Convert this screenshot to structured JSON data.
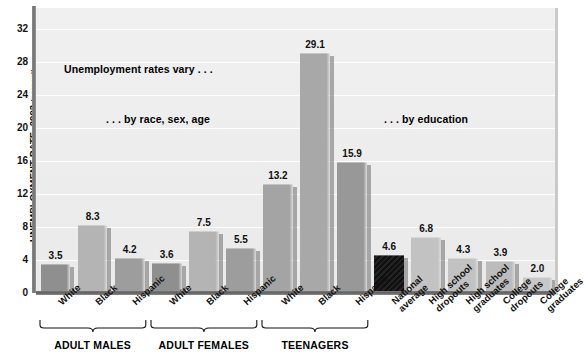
{
  "chart_data": {
    "type": "bar",
    "title": "",
    "xlabel": "",
    "ylabel": "UNEMPLOYMENT RATE, 2003",
    "ylabel_unit": "(percent)",
    "ylim": [
      0,
      34
    ],
    "yticks": [
      0,
      4,
      8,
      12,
      16,
      20,
      24,
      28,
      32
    ],
    "grid": true,
    "legend": "none",
    "categories": [
      "White",
      "Black",
      "Hispanic",
      "White",
      "Black",
      "Hispanic",
      "White",
      "Black",
      "Hispanic",
      "National average",
      "High school dropouts",
      "High school graduates",
      "College dropouts",
      "College graduates"
    ],
    "values": [
      3.5,
      8.3,
      4.2,
      3.6,
      7.5,
      5.5,
      13.2,
      29.1,
      15.9,
      4.6,
      6.8,
      4.3,
      3.9,
      2.0
    ],
    "groups": [
      {
        "label": "ADULT MALES",
        "start": 0,
        "end": 2
      },
      {
        "label": "ADULT FEMALES",
        "start": 3,
        "end": 5
      },
      {
        "label": "TEENAGERS",
        "start": 6,
        "end": 8
      }
    ],
    "annotations": [
      "Unemployment rates vary . . .",
      ". . . by race, sex, age",
      ". . . by education"
    ]
  },
  "bars": [
    {
      "label": "White",
      "value": 3.5,
      "display": "3.5",
      "color": "#8f8f8f"
    },
    {
      "label": "Black",
      "value": 8.3,
      "display": "8.3",
      "color": "#b4b4b4"
    },
    {
      "label": "Hispanic",
      "value": 4.2,
      "display": "4.2",
      "color": "#9d9d9d"
    },
    {
      "label": "White",
      "value": 3.6,
      "display": "3.6",
      "color": "#8f8f8f"
    },
    {
      "label": "Black",
      "value": 7.5,
      "display": "7.5",
      "color": "#b4b4b4"
    },
    {
      "label": "Hispanic",
      "value": 5.5,
      "display": "5.5",
      "color": "#9d9d9d"
    },
    {
      "label": "White",
      "value": 13.2,
      "display": "13.2",
      "color": "#a4a4a4"
    },
    {
      "label": "Black",
      "value": 29.1,
      "display": "29.1",
      "color": "#a8a8a8"
    },
    {
      "label": "Hispanic",
      "value": 15.9,
      "display": "15.9",
      "color": "#989898"
    },
    {
      "label": "National average",
      "value": 4.6,
      "display": "4.6",
      "color": "#141414"
    },
    {
      "label": "High school dropouts",
      "value": 6.8,
      "display": "6.8",
      "color": "#c2c2c2"
    },
    {
      "label": "High school graduates",
      "value": 4.3,
      "display": "4.3",
      "color": "#c2c2c2"
    },
    {
      "label": "College dropouts",
      "value": 3.9,
      "display": "3.9",
      "color": "#bcbcbc"
    },
    {
      "label": "College graduates",
      "value": 2.0,
      "display": "2.0",
      "color": "#c8c8c8"
    }
  ],
  "cat_labels": [
    {
      "line1": "White",
      "line2": ""
    },
    {
      "line1": "Black",
      "line2": ""
    },
    {
      "line1": "Hispanic",
      "line2": ""
    },
    {
      "line1": "White",
      "line2": ""
    },
    {
      "line1": "Black",
      "line2": ""
    },
    {
      "line1": "Hispanic",
      "line2": ""
    },
    {
      "line1": "White",
      "line2": ""
    },
    {
      "line1": "Black",
      "line2": ""
    },
    {
      "line1": "Hispanic",
      "line2": ""
    },
    {
      "line1": "National",
      "line2": "average"
    },
    {
      "line1": "High school",
      "line2": "dropouts"
    },
    {
      "line1": "High school",
      "line2": "graduates"
    },
    {
      "line1": "College",
      "line2": "dropouts"
    },
    {
      "line1": "College",
      "line2": "graduates"
    }
  ],
  "yticks": [
    "32",
    "28",
    "24",
    "20",
    "16",
    "12",
    "8",
    "4",
    "0"
  ],
  "axis": {
    "y_title": "UNEMPLOYMENT RATE, 2003",
    "y_title_unit": "(percent)"
  },
  "groups": [
    {
      "label": "ADULT MALES"
    },
    {
      "label": "ADULT FEMALES"
    },
    {
      "label": "TEENAGERS"
    }
  ],
  "annotations": {
    "a1": "Unemployment rates vary . . .",
    "a2": ". . . by race, sex, age",
    "a3": ". . . by education"
  },
  "colors": {
    "plot_bg": "#ededed",
    "gridline": "#ffffff",
    "axis": "#6f6f6f",
    "text": "#111111",
    "national_average_bar": "#141414"
  }
}
